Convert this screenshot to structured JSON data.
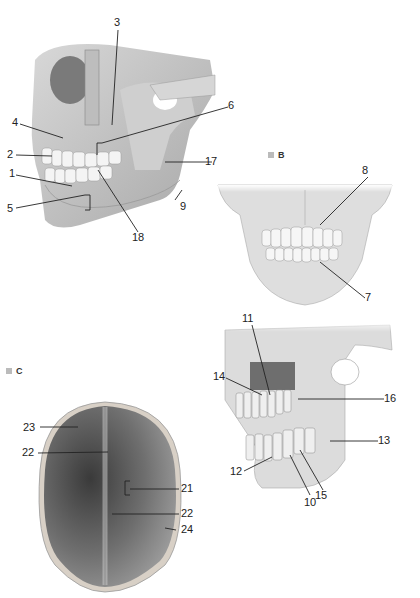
{
  "figure": {
    "panels": [
      {
        "id": "A",
        "label": "A",
        "view": "lateral skull jaw"
      },
      {
        "id": "B",
        "label": "B",
        "view": "anterior jaw"
      },
      {
        "id": "C",
        "label": "C",
        "view": "skull cap interior (superior)"
      }
    ],
    "callouts": {
      "n1": "1",
      "n2": "2",
      "n3": "3",
      "n4": "4",
      "n5": "5",
      "n6": "6",
      "n7": "7",
      "n8": "8",
      "n9": "9",
      "n10": "10",
      "n11": "11",
      "n12": "12",
      "n13": "13",
      "n14": "14",
      "n15": "15",
      "n16": "16",
      "n17": "17",
      "n18": "18",
      "n21": "21",
      "n22a": "22",
      "n22b": "22",
      "n23": "23",
      "n24": "24"
    },
    "colors": {
      "bone": "#e4e4e4",
      "bone_shade": "#b8b8b8",
      "dark": "#6a6a6a",
      "leader": "#222222",
      "tag": "#bbbbbb"
    }
  }
}
